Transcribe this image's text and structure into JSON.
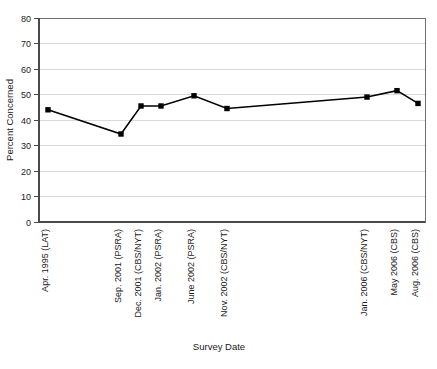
{
  "chart_data": {
    "type": "line",
    "title": "",
    "xlabel": "Survey Date",
    "ylabel": "Percent Concerned",
    "ylim": [
      0,
      80
    ],
    "ytick_step": 10,
    "yticks": [
      0,
      10,
      20,
      30,
      40,
      50,
      60,
      70,
      80
    ],
    "grid": true,
    "legend": "none",
    "marker": "square",
    "line_color": "#000000",
    "marker_color": "#000000",
    "grid_color": "#cfcfcf",
    "categories": [
      "Apr. 1995 (LAT)",
      "Sep. 2001 (PSRA)",
      "Dec. 2001 (CBS/NYT)",
      "Jan. 2002 (PSRA)",
      "June 2002 (PSRA)",
      "Nov. 2002 (CBS/NYT)",
      "Jan. 2006 (CBS/NYT)",
      "May 2006 (CBS)",
      "Aug. 2006 (CBS)"
    ],
    "values": [
      44,
      34.5,
      45.5,
      45.5,
      49.5,
      44.5,
      49,
      51.5,
      46.5
    ],
    "x_positions": [
      48,
      121,
      141,
      161,
      194,
      227,
      367,
      397,
      418
    ],
    "series": [
      {
        "name": "Percent Concerned",
        "values": [
          44,
          34.5,
          45.5,
          45.5,
          49.5,
          44.5,
          49,
          51.5,
          46.5
        ]
      }
    ]
  },
  "axes": {
    "y_title": "Percent Concerned",
    "x_title": "Survey Date"
  },
  "ticks": {
    "y": [
      "80",
      "70",
      "60",
      "50",
      "40",
      "30",
      "20",
      "10",
      "0"
    ]
  }
}
